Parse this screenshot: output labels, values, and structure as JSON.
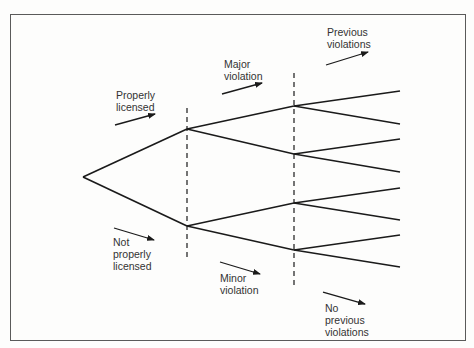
{
  "diagram": {
    "type": "decision-tree",
    "colors": {
      "line": "#1a1a1a",
      "text": "#333333",
      "frame": "#5a5a5a",
      "background": "#fdfdfc"
    },
    "root": {
      "x": 83,
      "y": 177
    },
    "levels": [
      {
        "name": "licensing",
        "divider_x": 187,
        "branches": [
          {
            "key": "properly_licensed",
            "label_lines": [
              "Properly",
              "licensed"
            ],
            "arrow": "up-right"
          },
          {
            "key": "not_properly_licensed",
            "label_lines": [
              "Not",
              "properly",
              "licensed"
            ],
            "arrow": "down-right"
          }
        ]
      },
      {
        "name": "violation_severity",
        "divider_x": 294,
        "branches": [
          {
            "key": "major_violation",
            "label_lines": [
              "Major",
              "violation"
            ],
            "arrow": "up-right"
          },
          {
            "key": "minor_violation",
            "label_lines": [
              "Minor",
              "violation"
            ],
            "arrow": "down-right"
          }
        ]
      },
      {
        "name": "violation_history",
        "leaf_x": 400,
        "branches": [
          {
            "key": "previous_violations",
            "label_lines": [
              "Previous",
              "violations"
            ],
            "arrow": "up-right"
          },
          {
            "key": "no_previous_violations",
            "label_lines": [
              "No",
              "previous",
              "violations"
            ],
            "arrow": "down-right"
          }
        ]
      }
    ],
    "nodes": {
      "level1": [
        {
          "x": 187,
          "y": 129
        },
        {
          "x": 187,
          "y": 226
        }
      ],
      "level2": [
        {
          "x": 294,
          "y": 106
        },
        {
          "x": 294,
          "y": 154
        },
        {
          "x": 294,
          "y": 203
        },
        {
          "x": 294,
          "y": 250
        }
      ],
      "leaves_y": [
        91,
        124,
        139,
        172,
        188,
        220,
        235,
        267
      ]
    },
    "labels": {
      "properly_licensed": {
        "line1": "Properly",
        "line2": "licensed"
      },
      "not_properly_licensed": {
        "line1": "Not",
        "line2": "properly",
        "line3": "licensed"
      },
      "major_violation": {
        "line1": "Major",
        "line2": "violation"
      },
      "minor_violation": {
        "line1": "Minor",
        "line2": "violation"
      },
      "previous_violations": {
        "line1": "Previous",
        "line2": "violations"
      },
      "no_previous_violations": {
        "line1": "No",
        "line2": "previous",
        "line3": "violations"
      }
    }
  }
}
